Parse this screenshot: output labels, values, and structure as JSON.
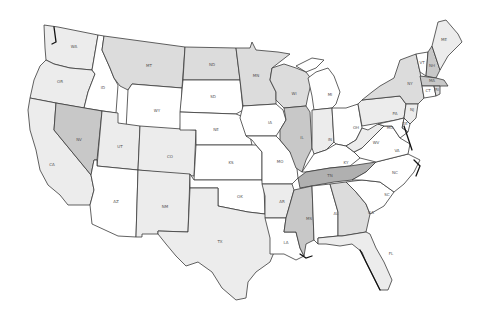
{
  "map": {
    "type": "choropleth",
    "region": "United States (contiguous)",
    "shades": {
      "white": "#ffffff",
      "light": "#ececec",
      "medium": "#dcdcdc",
      "dark": "#c4c4c4",
      "darker": "#b0b0b0",
      "border": "#3a3a3a"
    },
    "states": [
      {
        "abbr": "WA",
        "shade": "light"
      },
      {
        "abbr": "OR",
        "shade": "light"
      },
      {
        "abbr": "CA",
        "shade": "light"
      },
      {
        "abbr": "ID",
        "shade": "white"
      },
      {
        "abbr": "NV",
        "shade": "dark"
      },
      {
        "abbr": "MT",
        "shade": "medium"
      },
      {
        "abbr": "WY",
        "shade": "white"
      },
      {
        "abbr": "UT",
        "shade": "light"
      },
      {
        "abbr": "AZ",
        "shade": "white"
      },
      {
        "abbr": "CO",
        "shade": "light"
      },
      {
        "abbr": "NM",
        "shade": "light"
      },
      {
        "abbr": "ND",
        "shade": "medium"
      },
      {
        "abbr": "SD",
        "shade": "white"
      },
      {
        "abbr": "NE",
        "shade": "white"
      },
      {
        "abbr": "KS",
        "shade": "white"
      },
      {
        "abbr": "OK",
        "shade": "white"
      },
      {
        "abbr": "TX",
        "shade": "light"
      },
      {
        "abbr": "MN",
        "shade": "medium"
      },
      {
        "abbr": "IA",
        "shade": "white"
      },
      {
        "abbr": "MO",
        "shade": "white"
      },
      {
        "abbr": "AR",
        "shade": "light"
      },
      {
        "abbr": "LA",
        "shade": "white"
      },
      {
        "abbr": "WI",
        "shade": "medium"
      },
      {
        "abbr": "IL",
        "shade": "dark"
      },
      {
        "abbr": "MI",
        "shade": "white"
      },
      {
        "abbr": "IN",
        "shade": "light"
      },
      {
        "abbr": "OH",
        "shade": "white"
      },
      {
        "abbr": "KY",
        "shade": "white"
      },
      {
        "abbr": "TN",
        "shade": "darker"
      },
      {
        "abbr": "MS",
        "shade": "dark"
      },
      {
        "abbr": "AL",
        "shade": "white"
      },
      {
        "abbr": "GA",
        "shade": "medium"
      },
      {
        "abbr": "FL",
        "shade": "light"
      },
      {
        "abbr": "SC",
        "shade": "white"
      },
      {
        "abbr": "NC",
        "shade": "white"
      },
      {
        "abbr": "VA",
        "shade": "white"
      },
      {
        "abbr": "WV",
        "shade": "light"
      },
      {
        "abbr": "PA",
        "shade": "light"
      },
      {
        "abbr": "NY",
        "shade": "medium"
      },
      {
        "abbr": "VT",
        "shade": "white"
      },
      {
        "abbr": "NH",
        "shade": "dark"
      },
      {
        "abbr": "ME",
        "shade": "light"
      },
      {
        "abbr": "MA",
        "shade": "dark"
      },
      {
        "abbr": "CT",
        "shade": "white"
      },
      {
        "abbr": "RI",
        "shade": "medium"
      },
      {
        "abbr": "NJ",
        "shade": "light"
      },
      {
        "abbr": "DE",
        "shade": "white"
      },
      {
        "abbr": "MD",
        "shade": "white"
      }
    ]
  }
}
